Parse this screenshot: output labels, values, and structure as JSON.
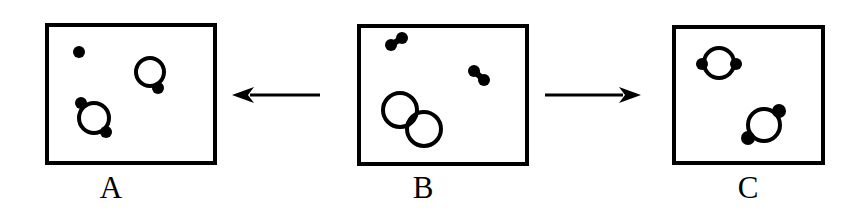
{
  "figure": {
    "title": "",
    "background_color": "#ffffff",
    "ink_color": "#000000",
    "width": 859,
    "height": 222
  },
  "chart_data": {
    "type": "diagram",
    "title": "",
    "xlabel": "",
    "ylabel": "",
    "panels": [
      {
        "id": "A",
        "label": "A",
        "box": {
          "x": 47,
          "y": 25,
          "width": 168,
          "height": 138,
          "stroke_width": 4
        },
        "label_position": {
          "x": 111,
          "y": 172
        },
        "circles": [
          {
            "name": "ring-with-one-dot",
            "cx": 150,
            "cy": 72,
            "r": 14,
            "stroke_width": 4,
            "dots": [
              {
                "name": "dot-lower-right",
                "cx": 158,
                "cy": 88,
                "r": 6
              }
            ]
          },
          {
            "name": "ring-with-two-dots",
            "cx": 94,
            "cy": 118,
            "r": 15,
            "stroke_width": 4,
            "dots": [
              {
                "name": "dot-upper-left",
                "cx": 81,
                "cy": 103,
                "r": 6
              },
              {
                "name": "dot-lower-right",
                "cx": 106,
                "cy": 132,
                "r": 6
              }
            ]
          }
        ],
        "free_dots": [
          {
            "name": "free-monomer-dot",
            "cx": 79,
            "cy": 52,
            "r": 6
          }
        ],
        "dimers": []
      },
      {
        "id": "B",
        "label": "B",
        "box": {
          "x": 359,
          "y": 26,
          "width": 168,
          "height": 138,
          "stroke_width": 4
        },
        "label_position": {
          "x": 423,
          "y": 172
        },
        "circles": [
          {
            "name": "plain-ring-upper-left",
            "cx": 400,
            "cy": 110,
            "r": 17,
            "stroke_width": 4,
            "dots": []
          },
          {
            "name": "plain-ring-lower-right",
            "cx": 424,
            "cy": 129,
            "r": 17,
            "stroke_width": 4,
            "dots": []
          }
        ],
        "free_dots": [],
        "dimers": [
          {
            "name": "free-dimer-upper-left",
            "dot_a": {
              "cx": 391,
              "cy": 45,
              "r": 6
            },
            "dot_b": {
              "cx": 402,
              "cy": 38,
              "r": 6
            },
            "bond_width": 6
          },
          {
            "name": "free-dimer-right",
            "dot_a": {
              "cx": 474,
              "cy": 71,
              "r": 6
            },
            "dot_b": {
              "cx": 484,
              "cy": 80,
              "r": 6
            },
            "bond_width": 6
          }
        ]
      },
      {
        "id": "C",
        "label": "C",
        "box": {
          "x": 674,
          "y": 27,
          "width": 149,
          "height": 136,
          "stroke_width": 4
        },
        "label_position": {
          "x": 748,
          "y": 172
        },
        "circles": [
          {
            "name": "ring-with-horizontal-dots",
            "cx": 719,
            "cy": 63,
            "r": 15,
            "stroke_width": 4,
            "dots": [
              {
                "name": "dot-left",
                "cx": 702,
                "cy": 64,
                "r": 6
              },
              {
                "name": "dot-right",
                "cx": 736,
                "cy": 64,
                "r": 6
              }
            ]
          },
          {
            "name": "ring-with-diagonal-dots",
            "cx": 764,
            "cy": 125,
            "r": 16,
            "stroke_width": 4,
            "dots": [
              {
                "name": "dot-upper-right",
                "cx": 779,
                "cy": 111,
                "r": 7
              },
              {
                "name": "dot-lower-left",
                "cx": 748,
                "cy": 138,
                "r": 7
              }
            ]
          }
        ],
        "free_dots": [],
        "dimers": []
      }
    ],
    "arrows": [
      {
        "name": "arrow-b-to-a",
        "direction": "left",
        "from_panel": "B",
        "to_panel": "A",
        "x1": 320,
        "y1": 95,
        "x2": 232,
        "y2": 95,
        "stroke_width": 3,
        "head_length": 22,
        "head_half_width": 8
      },
      {
        "name": "arrow-b-to-c",
        "direction": "right",
        "from_panel": "B",
        "to_panel": "C",
        "x1": 545,
        "y1": 95,
        "x2": 641,
        "y2": 95,
        "stroke_width": 3,
        "head_length": 22,
        "head_half_width": 8
      }
    ],
    "labels": [
      "A",
      "B",
      "C"
    ]
  }
}
